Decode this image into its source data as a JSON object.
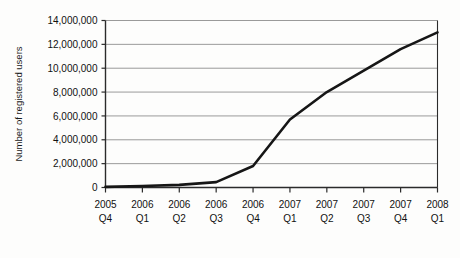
{
  "chart_data": {
    "type": "line",
    "title": "",
    "subtitle": "",
    "xlabel": "",
    "ylabel": "Number of registered users",
    "categories": [
      "2005 Q4",
      "2006 Q1",
      "2006 Q2",
      "2006 Q3",
      "2006 Q4",
      "2007 Q1",
      "2007 Q2",
      "2007 Q3",
      "2007 Q4",
      "2008 Q1"
    ],
    "category_lines": [
      {
        "year": "2005",
        "quarter": "Q4"
      },
      {
        "year": "2006",
        "quarter": "Q1"
      },
      {
        "year": "2006",
        "quarter": "Q2"
      },
      {
        "year": "2006",
        "quarter": "Q3"
      },
      {
        "year": "2006",
        "quarter": "Q4"
      },
      {
        "year": "2007",
        "quarter": "Q1"
      },
      {
        "year": "2007",
        "quarter": "Q2"
      },
      {
        "year": "2007",
        "quarter": "Q3"
      },
      {
        "year": "2007",
        "quarter": "Q4"
      },
      {
        "year": "2008",
        "quarter": "Q1"
      }
    ],
    "values": [
      50000,
      120000,
      220000,
      450000,
      1800000,
      5700000,
      8000000,
      9800000,
      11600000,
      13000000
    ],
    "ylim": [
      0,
      14000000
    ],
    "yticks": [
      0,
      2000000,
      4000000,
      6000000,
      8000000,
      10000000,
      12000000,
      14000000
    ],
    "ytick_labels": [
      "0",
      "2,000,000",
      "4,000,000",
      "6,000,000",
      "8,000,000",
      "10,000,000",
      "12,000,000",
      "14,000,000"
    ],
    "grid": "horizontal",
    "legend": "none",
    "series_color": "#161616",
    "grid_color": "#9a9a9a",
    "axis_color": "#2b2b2b",
    "background_color": "#fdfdfc"
  }
}
